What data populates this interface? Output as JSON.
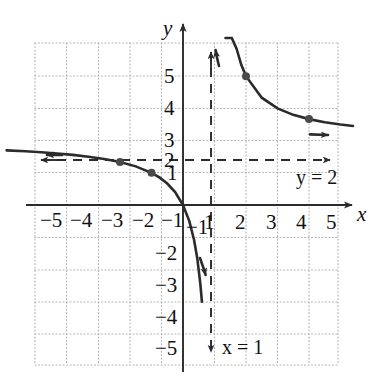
{
  "figure": {
    "kind": "cartesian-graph",
    "background": "#ffffff",
    "axis_labels": {
      "x": "x",
      "y": "y"
    },
    "annotations": [
      {
        "id": "horizontal-asymptote-label",
        "text": "y = 2",
        "var": "y",
        "value": "2",
        "x": 4.3,
        "y": 1.45
      },
      {
        "id": "vertical-asymptote-label",
        "text": "x = 1",
        "var": "x",
        "value": "1",
        "x": 1.45,
        "y": -5.35
      }
    ]
  },
  "chart_data": {
    "type": "line",
    "title": "",
    "xlabel": "x",
    "ylabel": "y",
    "xlim": [
      -5.6,
      5.6
    ],
    "ylim": [
      -5.6,
      5.6
    ],
    "grid": true,
    "grid_style": "dotted",
    "grid_step": 1,
    "legend": "none",
    "x_ticks": [
      -5,
      -4,
      -3,
      -2,
      -1,
      1,
      2,
      3,
      4,
      5
    ],
    "x_tick_labels": [
      "−5",
      "−4",
      "−3",
      "−2",
      "−1",
      "1",
      "2",
      "3",
      "4",
      "5"
    ],
    "y_ticks": [
      5,
      4,
      3,
      2,
      1,
      -1,
      -2,
      -3,
      -4,
      -5
    ],
    "y_tick_labels": [
      "5",
      "4",
      "3",
      "2",
      "1",
      "−1",
      "−2",
      "−3",
      "−4",
      "−5"
    ],
    "function": "y = 2x/(x-1)",
    "asymptotes": [
      {
        "name": "vertical",
        "equation": "x = 1",
        "axis": "x",
        "value": 1,
        "style": "dashed",
        "arrows": "both"
      },
      {
        "name": "horizontal",
        "equation": "y = 2",
        "axis": "y",
        "value": 2,
        "style": "dashed",
        "arrows": "both"
      }
    ],
    "series": [
      {
        "name": "left-branch",
        "domain": [
          -5.6,
          1
        ],
        "points": [
          [
            -5.6,
            1.697
          ],
          [
            -5.0,
            1.667
          ],
          [
            -4.5,
            1.636
          ],
          [
            -4.0,
            1.6
          ],
          [
            -3.5,
            1.556
          ],
          [
            -3.0,
            1.5
          ],
          [
            -2.5,
            1.429
          ],
          [
            -2.0,
            1.333
          ],
          [
            -1.5,
            1.2
          ],
          [
            -1.0,
            1.0
          ],
          [
            -0.75,
            0.857
          ],
          [
            -0.5,
            0.667
          ],
          [
            -0.25,
            0.4
          ],
          [
            0,
            0
          ],
          [
            0.2,
            -0.5
          ],
          [
            0.35,
            -1.077
          ],
          [
            0.45,
            -1.636
          ],
          [
            0.55,
            -2.444
          ],
          [
            0.6,
            -3.0
          ]
        ],
        "marked_points": [
          [
            -2,
            1.333
          ],
          [
            -1,
            1.0
          ]
        ],
        "arrow_ends": [
          "left",
          "bottom"
        ]
      },
      {
        "name": "right-branch",
        "domain": [
          1,
          5.6
        ],
        "points": [
          [
            1.35,
            7.714
          ],
          [
            1.45,
            6.444
          ],
          [
            1.55,
            5.636
          ],
          [
            1.7,
            4.857
          ],
          [
            1.85,
            4.353
          ],
          [
            2.0,
            4.0
          ],
          [
            2.5,
            3.333
          ],
          [
            3.0,
            3.0
          ],
          [
            3.5,
            2.8
          ],
          [
            4.0,
            2.667
          ],
          [
            4.5,
            2.571
          ],
          [
            5.0,
            2.5
          ],
          [
            5.4,
            2.455
          ]
        ],
        "marked_points": [
          [
            2,
            4.0
          ],
          [
            4,
            2.667
          ]
        ],
        "arrow_ends": [
          "top",
          "right"
        ]
      }
    ]
  },
  "style": {
    "curve_color": "#2b2b2b",
    "axis_color": "#2b2b2b",
    "grid_color": "#b9b9b9",
    "asymptote_color": "#2b2b2b",
    "point_color": "#4a4a4a"
  }
}
